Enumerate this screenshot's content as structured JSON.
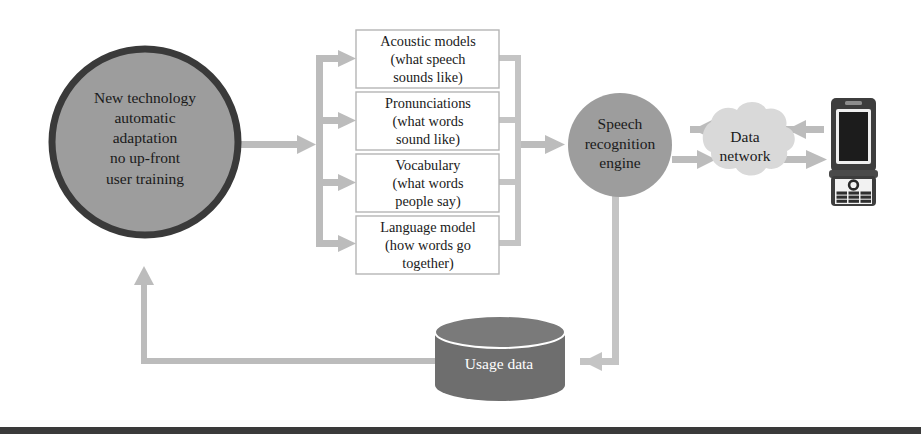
{
  "figure": {
    "background_color": "#ffffff",
    "width": 921,
    "height": 446
  },
  "palette": {
    "node_fill_gray": "#9d9d9d",
    "node_border_dark": "#3a3a3a",
    "arrow_gray": "#bcbcbc",
    "box_border": "#b5b5b5",
    "box_fill": "#ffffff",
    "cylinder_fill": "#6e6e6e",
    "cylinder_top": "#7a7a7a",
    "cloud_fill": "#d9d9d9",
    "phone_body": "#3d3d3d",
    "phone_screen": "#1c1c1c",
    "text_dark": "#1a1a1a",
    "text_light": "#ffffff",
    "bottom_rule": "#3a3a3a"
  },
  "nodes": {
    "main_circle": {
      "name": "new-technology-circle",
      "text": "New technology\nautomatic\nadaptation\nno up-front\nuser training",
      "shape": "circle",
      "cx": 145,
      "cy": 142,
      "r": 93
    },
    "engine_circle": {
      "name": "speech-recognition-engine",
      "text": "Speech\nrecognition\nengine",
      "shape": "circle",
      "cx": 620,
      "cy": 145,
      "r": 52
    },
    "cloud": {
      "name": "data-network-cloud",
      "text": "Data\nnetwork",
      "shape": "cloud"
    },
    "cylinder": {
      "name": "usage-data-store",
      "text": "Usage data",
      "shape": "cylinder"
    },
    "phone": {
      "name": "mobile-phone-device",
      "shape": "flip-phone",
      "screen_label": "",
      "keypad_rows": 4,
      "keypad_cols": 3
    }
  },
  "model_boxes": [
    {
      "name": "acoustic-models-box",
      "text": "Acoustic models\n(what speech\nsounds like)"
    },
    {
      "name": "pronunciations-box",
      "text": "Pronunciations\n(what words\nsound like)"
    },
    {
      "name": "vocabulary-box",
      "text": "Vocabulary\n(what words\npeople say)"
    },
    {
      "name": "language-model-box",
      "text": "Language model\n(how words go\ntogether)"
    }
  ],
  "connectors": [
    {
      "name": "circle-to-models-arrow",
      "from": "main_circle",
      "to": "model_boxes",
      "direction": "right"
    },
    {
      "name": "models-to-engine-arrow",
      "from": "model_boxes",
      "to": "engine_circle",
      "direction": "right"
    },
    {
      "name": "engine-to-network-arrow",
      "from": "engine_circle",
      "to": "cloud",
      "direction": "right"
    },
    {
      "name": "network-to-engine-arrow",
      "from": "cloud",
      "to": "engine_circle",
      "direction": "left"
    },
    {
      "name": "network-to-phone-arrow",
      "from": "cloud",
      "to": "phone",
      "direction": "right"
    },
    {
      "name": "phone-to-network-arrow",
      "from": "phone",
      "to": "cloud",
      "direction": "left"
    },
    {
      "name": "engine-to-usage-arrow",
      "from": "engine_circle",
      "to": "cylinder",
      "direction": "left"
    },
    {
      "name": "usage-to-circle-arrow",
      "from": "cylinder",
      "to": "main_circle",
      "direction": "up"
    }
  ]
}
